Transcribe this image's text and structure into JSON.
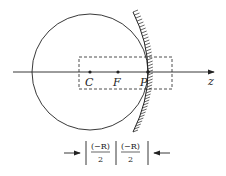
{
  "diagram": {
    "type": "concave-mirror-geometry",
    "axis_label": "z",
    "points": [
      {
        "label": "C",
        "name": "center-of-curvature"
      },
      {
        "label": "F",
        "name": "focal-point"
      },
      {
        "label": "P",
        "name": "pole"
      }
    ],
    "dimension": {
      "left_num": "(−R)",
      "left_den": "2",
      "right_num": "(−R)",
      "right_den": "2"
    },
    "colors": {
      "stroke": "#222222",
      "background": "#ffffff"
    }
  }
}
